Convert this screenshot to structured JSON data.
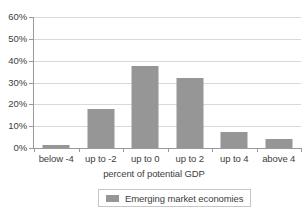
{
  "chart_data": {
    "type": "bar",
    "title": "",
    "subtitle": "",
    "xlabel": "percent of potential GDP",
    "ylabel": "",
    "categories": [
      "below -4",
      "up to -2",
      "up to 0",
      "up to 2",
      "up to 4",
      "above 4"
    ],
    "series": [
      {
        "name": "Emerging market economies",
        "color": "#969696",
        "values": [
          1.2,
          18.0,
          37.5,
          32.0,
          7.5,
          4.0
        ]
      }
    ],
    "values": [
      1.2,
      18.0,
      37.5,
      32.0,
      7.5,
      4.0
    ],
    "ylim": [
      0,
      60
    ],
    "ytick_values": [
      0,
      10,
      20,
      30,
      40,
      50,
      60
    ],
    "ytick_labels": [
      "0%",
      "10%",
      "20%",
      "30%",
      "40%",
      "50%",
      "60%"
    ],
    "grid": "horizontal",
    "legend_position": "bottom",
    "value_format": "percent",
    "background_color": "#ffffff",
    "gridline_color": "#d9d9d9",
    "axis_color": "#9a9a9a"
  },
  "legend": {
    "entries": [
      {
        "label": "Emerging market economies",
        "color": "#969696"
      }
    ]
  }
}
